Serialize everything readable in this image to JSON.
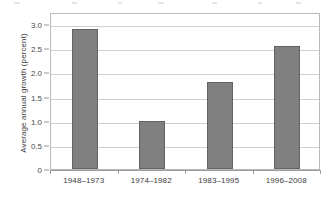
{
  "chart_data": {
    "type": "bar",
    "title": "",
    "subtitle": "",
    "xlabel": "",
    "ylabel": "Average annual growth (percent)",
    "categories": [
      "1948–1973",
      "1974–1982",
      "1983–1995",
      "1996–2008"
    ],
    "values": [
      2.9,
      1.0,
      1.8,
      2.55
    ],
    "series": [
      {
        "name": "Average annual growth",
        "values": [
          2.9,
          1.0,
          1.8,
          2.55
        ]
      }
    ],
    "ylim": [
      0,
      3.1
    ],
    "ytick_values": [
      0,
      0.5,
      1.0,
      1.5,
      2.0,
      2.5,
      3.0
    ],
    "ytick_labels": [
      "0",
      "0.5",
      "1.0",
      "1.5",
      "2.0",
      "2.5",
      "3.0"
    ],
    "grid": "horizontal",
    "legend": "none",
    "bar_color": "#808080",
    "bar_border_color": "#636363",
    "gridline_color": "#cfcfcf",
    "plot_border_color": "#b9b9b9",
    "axis_color": "#9a9a9a",
    "text_color": "#3b3b3b",
    "background": "#ffffff",
    "annotations": []
  }
}
